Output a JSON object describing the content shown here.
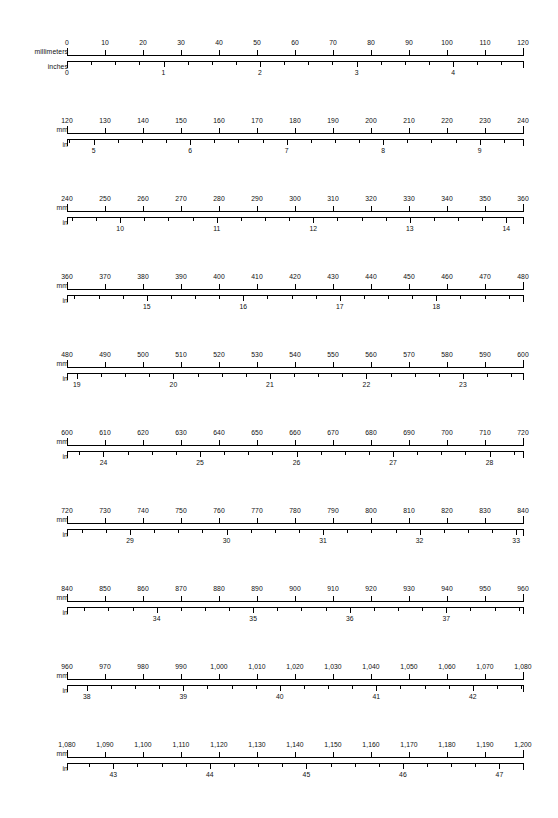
{
  "document": {
    "title": "Millimeter to Inch Ruler Conversion Chart",
    "text_color": "#111111",
    "line_color": "#000000",
    "background_color": "#ffffff"
  },
  "geometry": {
    "ruler_left_px": 67,
    "ruler_width_px": 456,
    "mm_span_per_row": 120,
    "row_pitch_px": 78,
    "first_row_top_px": 28,
    "mm_tick_step": 10,
    "inch_subdivision": 0.25,
    "mm_per_inch": 25.4
  },
  "rows": [
    {
      "mm_axis_label": "millimeters",
      "in_axis_label": "inches",
      "mm_start": 0,
      "mm_end": 120,
      "mm_ticks": [
        {
          "mm": 0,
          "label": "0"
        },
        {
          "mm": 10,
          "label": "10"
        },
        {
          "mm": 20,
          "label": "20"
        },
        {
          "mm": 30,
          "label": "30"
        },
        {
          "mm": 40,
          "label": "40"
        },
        {
          "mm": 50,
          "label": "50"
        },
        {
          "mm": 60,
          "label": "60"
        },
        {
          "mm": 70,
          "label": "70"
        },
        {
          "mm": 80,
          "label": "80"
        },
        {
          "mm": 90,
          "label": "90"
        },
        {
          "mm": 100,
          "label": "100"
        },
        {
          "mm": 110,
          "label": "110"
        },
        {
          "mm": 120,
          "label": "120"
        }
      ],
      "in_labels": [
        {
          "inch": 0,
          "label": "0"
        },
        {
          "inch": 1,
          "label": "1"
        },
        {
          "inch": 2,
          "label": "2"
        },
        {
          "inch": 3,
          "label": "3"
        },
        {
          "inch": 4,
          "label": "4"
        }
      ]
    },
    {
      "mm_axis_label": "mm",
      "in_axis_label": "in",
      "mm_start": 120,
      "mm_end": 240,
      "mm_ticks": [
        {
          "mm": 120,
          "label": "120"
        },
        {
          "mm": 130,
          "label": "130"
        },
        {
          "mm": 140,
          "label": "140"
        },
        {
          "mm": 150,
          "label": "150"
        },
        {
          "mm": 160,
          "label": "160"
        },
        {
          "mm": 170,
          "label": "170"
        },
        {
          "mm": 180,
          "label": "180"
        },
        {
          "mm": 190,
          "label": "190"
        },
        {
          "mm": 200,
          "label": "200"
        },
        {
          "mm": 210,
          "label": "210"
        },
        {
          "mm": 220,
          "label": "220"
        },
        {
          "mm": 230,
          "label": "230"
        },
        {
          "mm": 240,
          "label": "240"
        }
      ],
      "in_labels": [
        {
          "inch": 5,
          "label": "5"
        },
        {
          "inch": 6,
          "label": "6"
        },
        {
          "inch": 7,
          "label": "7"
        },
        {
          "inch": 8,
          "label": "8"
        },
        {
          "inch": 9,
          "label": "9"
        }
      ]
    },
    {
      "mm_axis_label": "mm",
      "in_axis_label": "in",
      "mm_start": 240,
      "mm_end": 360,
      "mm_ticks": [
        {
          "mm": 240,
          "label": "240"
        },
        {
          "mm": 250,
          "label": "250"
        },
        {
          "mm": 260,
          "label": "260"
        },
        {
          "mm": 270,
          "label": "270"
        },
        {
          "mm": 280,
          "label": "280"
        },
        {
          "mm": 290,
          "label": "290"
        },
        {
          "mm": 300,
          "label": "300"
        },
        {
          "mm": 310,
          "label": "310"
        },
        {
          "mm": 320,
          "label": "320"
        },
        {
          "mm": 330,
          "label": "330"
        },
        {
          "mm": 340,
          "label": "340"
        },
        {
          "mm": 350,
          "label": "350"
        },
        {
          "mm": 360,
          "label": "360"
        }
      ],
      "in_labels": [
        {
          "inch": 10,
          "label": "10"
        },
        {
          "inch": 11,
          "label": "11"
        },
        {
          "inch": 12,
          "label": "12"
        },
        {
          "inch": 13,
          "label": "13"
        },
        {
          "inch": 14,
          "label": "14"
        }
      ]
    },
    {
      "mm_axis_label": "mm",
      "in_axis_label": "in",
      "mm_start": 360,
      "mm_end": 480,
      "mm_ticks": [
        {
          "mm": 360,
          "label": "360"
        },
        {
          "mm": 370,
          "label": "370"
        },
        {
          "mm": 380,
          "label": "380"
        },
        {
          "mm": 390,
          "label": "390"
        },
        {
          "mm": 400,
          "label": "400"
        },
        {
          "mm": 410,
          "label": "410"
        },
        {
          "mm": 420,
          "label": "420"
        },
        {
          "mm": 430,
          "label": "430"
        },
        {
          "mm": 440,
          "label": "440"
        },
        {
          "mm": 450,
          "label": "450"
        },
        {
          "mm": 460,
          "label": "460"
        },
        {
          "mm": 470,
          "label": "470"
        },
        {
          "mm": 480,
          "label": "480"
        }
      ],
      "in_labels": [
        {
          "inch": 15,
          "label": "15"
        },
        {
          "inch": 16,
          "label": "16"
        },
        {
          "inch": 17,
          "label": "17"
        },
        {
          "inch": 18,
          "label": "18"
        }
      ]
    },
    {
      "mm_axis_label": "mm",
      "in_axis_label": "in",
      "mm_start": 480,
      "mm_end": 600,
      "mm_ticks": [
        {
          "mm": 480,
          "label": "480"
        },
        {
          "mm": 490,
          "label": "490"
        },
        {
          "mm": 500,
          "label": "500"
        },
        {
          "mm": 510,
          "label": "510"
        },
        {
          "mm": 520,
          "label": "520"
        },
        {
          "mm": 530,
          "label": "530"
        },
        {
          "mm": 540,
          "label": "540"
        },
        {
          "mm": 550,
          "label": "550"
        },
        {
          "mm": 560,
          "label": "560"
        },
        {
          "mm": 570,
          "label": "570"
        },
        {
          "mm": 580,
          "label": "580"
        },
        {
          "mm": 590,
          "label": "590"
        },
        {
          "mm": 600,
          "label": "600"
        }
      ],
      "in_labels": [
        {
          "inch": 19,
          "label": "19"
        },
        {
          "inch": 20,
          "label": "20"
        },
        {
          "inch": 21,
          "label": "21"
        },
        {
          "inch": 22,
          "label": "22"
        },
        {
          "inch": 23,
          "label": "23"
        }
      ]
    },
    {
      "mm_axis_label": "mm",
      "in_axis_label": "in",
      "mm_start": 600,
      "mm_end": 720,
      "mm_ticks": [
        {
          "mm": 600,
          "label": "600"
        },
        {
          "mm": 610,
          "label": "610"
        },
        {
          "mm": 620,
          "label": "620"
        },
        {
          "mm": 630,
          "label": "630"
        },
        {
          "mm": 640,
          "label": "640"
        },
        {
          "mm": 650,
          "label": "650"
        },
        {
          "mm": 660,
          "label": "660"
        },
        {
          "mm": 670,
          "label": "670"
        },
        {
          "mm": 680,
          "label": "680"
        },
        {
          "mm": 690,
          "label": "690"
        },
        {
          "mm": 700,
          "label": "700"
        },
        {
          "mm": 710,
          "label": "710"
        },
        {
          "mm": 720,
          "label": "720"
        }
      ],
      "in_labels": [
        {
          "inch": 24,
          "label": "24"
        },
        {
          "inch": 25,
          "label": "25"
        },
        {
          "inch": 26,
          "label": "26"
        },
        {
          "inch": 27,
          "label": "27"
        },
        {
          "inch": 28,
          "label": "28"
        }
      ]
    },
    {
      "mm_axis_label": "mm",
      "in_axis_label": "in",
      "mm_start": 720,
      "mm_end": 840,
      "mm_ticks": [
        {
          "mm": 720,
          "label": "720"
        },
        {
          "mm": 730,
          "label": "730"
        },
        {
          "mm": 740,
          "label": "740"
        },
        {
          "mm": 750,
          "label": "750"
        },
        {
          "mm": 760,
          "label": "760"
        },
        {
          "mm": 770,
          "label": "770"
        },
        {
          "mm": 780,
          "label": "780"
        },
        {
          "mm": 790,
          "label": "790"
        },
        {
          "mm": 800,
          "label": "800"
        },
        {
          "mm": 810,
          "label": "810"
        },
        {
          "mm": 820,
          "label": "820"
        },
        {
          "mm": 830,
          "label": "830"
        },
        {
          "mm": 840,
          "label": "840"
        }
      ],
      "in_labels": [
        {
          "inch": 29,
          "label": "29"
        },
        {
          "inch": 30,
          "label": "30"
        },
        {
          "inch": 31,
          "label": "31"
        },
        {
          "inch": 32,
          "label": "32"
        },
        {
          "inch": 33,
          "label": "33"
        }
      ]
    },
    {
      "mm_axis_label": "mm",
      "in_axis_label": "in",
      "mm_start": 840,
      "mm_end": 960,
      "mm_ticks": [
        {
          "mm": 840,
          "label": "840"
        },
        {
          "mm": 850,
          "label": "850"
        },
        {
          "mm": 860,
          "label": "860"
        },
        {
          "mm": 870,
          "label": "870"
        },
        {
          "mm": 880,
          "label": "880"
        },
        {
          "mm": 890,
          "label": "890"
        },
        {
          "mm": 900,
          "label": "900"
        },
        {
          "mm": 910,
          "label": "910"
        },
        {
          "mm": 920,
          "label": "920"
        },
        {
          "mm": 930,
          "label": "930"
        },
        {
          "mm": 940,
          "label": "940"
        },
        {
          "mm": 950,
          "label": "950"
        },
        {
          "mm": 960,
          "label": "960"
        }
      ],
      "in_labels": [
        {
          "inch": 34,
          "label": "34"
        },
        {
          "inch": 35,
          "label": "35"
        },
        {
          "inch": 36,
          "label": "36"
        },
        {
          "inch": 37,
          "label": "37"
        }
      ]
    },
    {
      "mm_axis_label": "mm",
      "in_axis_label": "in",
      "mm_start": 960,
      "mm_end": 1080,
      "mm_ticks": [
        {
          "mm": 960,
          "label": "960"
        },
        {
          "mm": 970,
          "label": "970"
        },
        {
          "mm": 980,
          "label": "980"
        },
        {
          "mm": 990,
          "label": "990"
        },
        {
          "mm": 1000,
          "label": "1,000"
        },
        {
          "mm": 1010,
          "label": "1,010"
        },
        {
          "mm": 1020,
          "label": "1,020"
        },
        {
          "mm": 1030,
          "label": "1,030"
        },
        {
          "mm": 1040,
          "label": "1,040"
        },
        {
          "mm": 1050,
          "label": "1,050"
        },
        {
          "mm": 1060,
          "label": "1,060"
        },
        {
          "mm": 1070,
          "label": "1,070"
        },
        {
          "mm": 1080,
          "label": "1,080"
        }
      ],
      "in_labels": [
        {
          "inch": 38,
          "label": "38"
        },
        {
          "inch": 39,
          "label": "39"
        },
        {
          "inch": 40,
          "label": "40"
        },
        {
          "inch": 41,
          "label": "41"
        },
        {
          "inch": 42,
          "label": "42"
        }
      ]
    },
    {
      "mm_axis_label": "mm",
      "in_axis_label": "in",
      "mm_start": 1080,
      "mm_end": 1200,
      "mm_ticks": [
        {
          "mm": 1080,
          "label": "1,080"
        },
        {
          "mm": 1090,
          "label": "1,090"
        },
        {
          "mm": 1100,
          "label": "1,100"
        },
        {
          "mm": 1110,
          "label": "1,110"
        },
        {
          "mm": 1120,
          "label": "1,120"
        },
        {
          "mm": 1130,
          "label": "1,130"
        },
        {
          "mm": 1140,
          "label": "1,140"
        },
        {
          "mm": 1150,
          "label": "1,150"
        },
        {
          "mm": 1160,
          "label": "1,160"
        },
        {
          "mm": 1170,
          "label": "1,170"
        },
        {
          "mm": 1180,
          "label": "1,180"
        },
        {
          "mm": 1190,
          "label": "1,190"
        },
        {
          "mm": 1200,
          "label": "1,200"
        }
      ],
      "in_labels": [
        {
          "inch": 43,
          "label": "43"
        },
        {
          "inch": 44,
          "label": "44"
        },
        {
          "inch": 45,
          "label": "45"
        },
        {
          "inch": 46,
          "label": "46"
        },
        {
          "inch": 47,
          "label": "47"
        }
      ]
    }
  ]
}
